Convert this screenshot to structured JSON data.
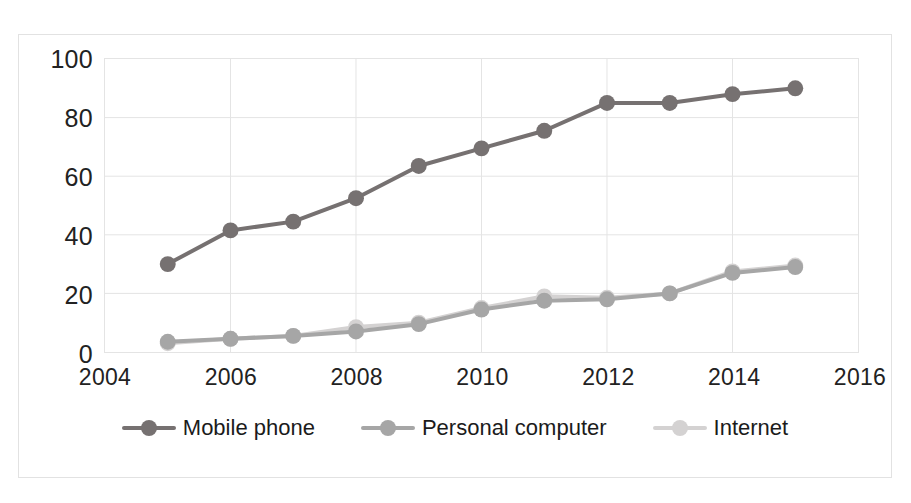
{
  "chart_data": {
    "type": "line",
    "title": "",
    "subtitle": "",
    "xlabel": "",
    "ylabel": "",
    "x": [
      2005,
      2006,
      2007,
      2008,
      2009,
      2010,
      2011,
      2012,
      2013,
      2014,
      2015
    ],
    "xlim": [
      2004,
      2016
    ],
    "ylim": [
      0,
      100
    ],
    "x_ticks": [
      2004,
      2006,
      2008,
      2010,
      2012,
      2014,
      2016
    ],
    "y_ticks": [
      0,
      20,
      40,
      60,
      80,
      100
    ],
    "grid": true,
    "legend_position": "bottom",
    "markers": "circle",
    "series": [
      {
        "name": "Mobile phone",
        "color": "#767171",
        "values": [
          30,
          41.5,
          44.5,
          52.5,
          63.5,
          69.5,
          75.5,
          85,
          85,
          88,
          90
        ]
      },
      {
        "name": "Personal computer",
        "color": "#a6a6a6",
        "values": [
          3.5,
          4.5,
          5.5,
          7,
          9.5,
          14.5,
          17.5,
          18,
          20,
          27,
          29
        ]
      },
      {
        "name": "Internet",
        "color": "#d4d2d2",
        "values": [
          3,
          4.5,
          5.5,
          8.5,
          10,
          15,
          19,
          18.5,
          20,
          27.5,
          29.5
        ]
      }
    ]
  },
  "axes": {
    "y_tick_labels": [
      "100",
      "80",
      "60",
      "40",
      "20",
      "0"
    ],
    "x_tick_labels": [
      "2004",
      "2006",
      "2008",
      "2010",
      "2012",
      "2014",
      "2016"
    ]
  },
  "legend": {
    "items": [
      {
        "label": "Mobile phone",
        "color": "#767171"
      },
      {
        "label": "Personal computer",
        "color": "#a6a6a6"
      },
      {
        "label": "Internet",
        "color": "#d4d2d2"
      }
    ]
  },
  "style": {
    "background": "#ffffff",
    "grid_color": "#e4e4e4",
    "border_color": "#e2e2e2",
    "text_color": "#222222"
  }
}
